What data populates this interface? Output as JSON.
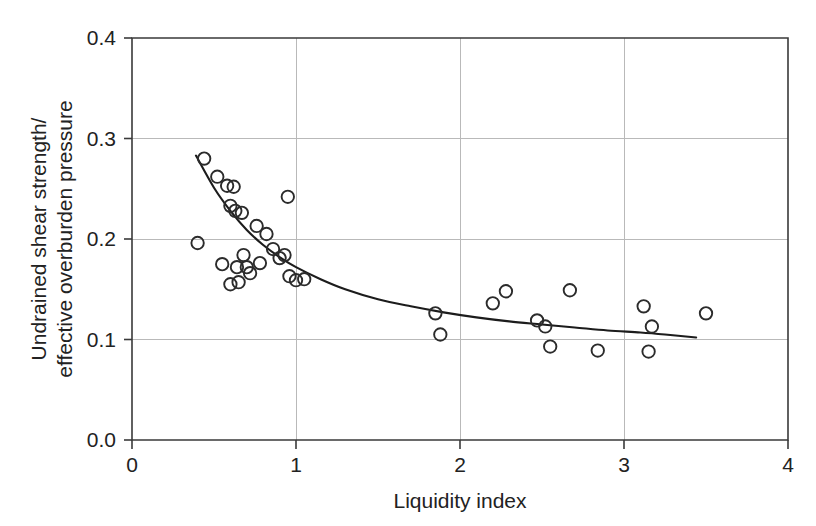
{
  "chart_data": {
    "type": "scatter",
    "title": "",
    "xlabel": "Liquidity index",
    "ylabel": "Undrained shear strength/\neffective overburden pressure",
    "ylabel_line1": "Undrained shear strength/",
    "ylabel_line2": "effective overburden pressure",
    "xlim": [
      0,
      4
    ],
    "ylim": [
      0.0,
      0.4
    ],
    "xticks": [
      0,
      1,
      2,
      3,
      4
    ],
    "xtick_labels": [
      "0",
      "1",
      "2",
      "3",
      "4"
    ],
    "yticks": [
      0.0,
      0.1,
      0.2,
      0.3,
      0.4
    ],
    "ytick_labels": [
      "0.0",
      "0.1",
      "0.2",
      "0.3",
      "0.4"
    ],
    "grid": true,
    "grid_color": "#b9b9b9",
    "legend": null,
    "marker": "open-circle",
    "marker_color": "#2b2b2b",
    "curve_color": "#1c1c1c",
    "series": [
      {
        "name": "Measured data",
        "type": "scatter",
        "points": [
          [
            0.4,
            0.196
          ],
          [
            0.44,
            0.28
          ],
          [
            0.52,
            0.262
          ],
          [
            0.55,
            0.175
          ],
          [
            0.58,
            0.253
          ],
          [
            0.6,
            0.233
          ],
          [
            0.6,
            0.155
          ],
          [
            0.62,
            0.252
          ],
          [
            0.63,
            0.228
          ],
          [
            0.64,
            0.172
          ],
          [
            0.65,
            0.157
          ],
          [
            0.67,
            0.226
          ],
          [
            0.68,
            0.184
          ],
          [
            0.7,
            0.172
          ],
          [
            0.72,
            0.166
          ],
          [
            0.76,
            0.213
          ],
          [
            0.78,
            0.176
          ],
          [
            0.82,
            0.205
          ],
          [
            0.86,
            0.19
          ],
          [
            0.9,
            0.181
          ],
          [
            0.93,
            0.184
          ],
          [
            0.95,
            0.242
          ],
          [
            0.96,
            0.163
          ],
          [
            1.0,
            0.159
          ],
          [
            1.05,
            0.16
          ],
          [
            1.85,
            0.126
          ],
          [
            1.88,
            0.105
          ],
          [
            2.2,
            0.136
          ],
          [
            2.28,
            0.148
          ],
          [
            2.47,
            0.119
          ],
          [
            2.52,
            0.113
          ],
          [
            2.55,
            0.093
          ],
          [
            2.67,
            0.149
          ],
          [
            2.84,
            0.089
          ],
          [
            3.12,
            0.133
          ],
          [
            3.15,
            0.088
          ],
          [
            3.17,
            0.113
          ],
          [
            3.5,
            0.126
          ]
        ]
      },
      {
        "name": "Fitted trend curve",
        "type": "line",
        "x_start": 0.39,
        "x_end": 3.44,
        "y_start": 0.283,
        "y_end": 0.102,
        "points": [
          [
            0.39,
            0.283
          ],
          [
            0.5,
            0.251
          ],
          [
            0.6,
            0.228
          ],
          [
            0.7,
            0.209
          ],
          [
            0.8,
            0.194
          ],
          [
            0.9,
            0.182
          ],
          [
            1.0,
            0.172
          ],
          [
            1.15,
            0.16
          ],
          [
            1.3,
            0.15
          ],
          [
            1.5,
            0.14
          ],
          [
            1.7,
            0.133
          ],
          [
            1.9,
            0.127
          ],
          [
            2.1,
            0.122
          ],
          [
            2.3,
            0.118
          ],
          [
            2.5,
            0.115
          ],
          [
            2.7,
            0.112
          ],
          [
            2.9,
            0.109
          ],
          [
            3.1,
            0.107
          ],
          [
            3.25,
            0.105
          ],
          [
            3.44,
            0.102
          ]
        ]
      }
    ]
  }
}
